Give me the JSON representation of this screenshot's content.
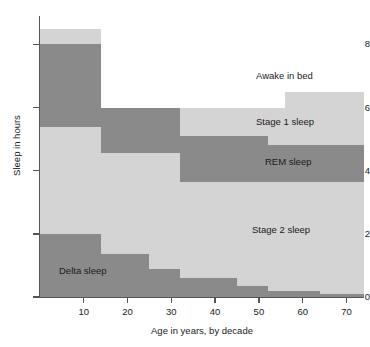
{
  "chart_data": {
    "type": "area",
    "title": "",
    "xlabel": "Age in years, by decade",
    "ylabel": "Sleep in hours",
    "xlim": [
      0,
      74
    ],
    "ylim": [
      0,
      8.9
    ],
    "xticks": [
      10,
      20,
      30,
      40,
      50,
      60,
      70
    ],
    "yticks": [
      0,
      2,
      4,
      6,
      8
    ],
    "grid": false,
    "legend_position": "inline-right",
    "stacking": "stacked-step",
    "x_breakpoints": [
      0,
      14,
      25,
      32,
      35,
      45,
      52,
      56,
      64,
      74
    ],
    "series": [
      {
        "name": "Delta sleep",
        "color": "#8a8a8a",
        "label_x": 14,
        "label_y": 0.95,
        "values": [
          2.0,
          1.35,
          0.9,
          0.6,
          0.6,
          0.35,
          0.2,
          0.2,
          0.1
        ]
      },
      {
        "name": "Stage 2 sleep",
        "color": "#d4d4d4",
        "label_x": 66,
        "label_y": 2.15,
        "values": [
          3.4,
          3.2,
          3.65,
          3.05,
          3.05,
          3.3,
          3.45,
          3.45,
          3.55
        ]
      },
      {
        "name": "REM sleep",
        "color": "#8a8a8a",
        "label_x": 66,
        "label_y": 4.35,
        "values": [
          2.6,
          1.45,
          1.45,
          1.45,
          1.45,
          1.45,
          1.15,
          1.15,
          1.15
        ]
      },
      {
        "name": "Stage 1 sleep",
        "color": "#d4d4d4",
        "label_x": 66,
        "label_y": 5.6,
        "values": [
          0.5,
          0.0,
          0.0,
          0.9,
          0.9,
          0.9,
          1.2,
          1.7,
          1.7
        ]
      },
      {
        "name": "Awake in bed",
        "color": "#ffffff",
        "label_x": 66,
        "label_y": 7.05,
        "values": [
          0.4,
          2.9,
          2.9,
          2.9,
          2.9,
          2.9,
          2.9,
          2.4,
          2.4
        ]
      }
    ],
    "totals": [
      8.5,
      6.0,
      6.0,
      6.0,
      6.0,
      6.0,
      6.0,
      6.5,
      6.5
    ]
  },
  "axis": {
    "ytick_labels": [
      "0",
      "2",
      "4",
      "6",
      "8"
    ],
    "xtick_labels": [
      "10",
      "20",
      "30",
      "40",
      "50",
      "60",
      "70"
    ],
    "ylabel": "Sleep in hours",
    "xlabel": "Age in years, by decade"
  },
  "band_labels": {
    "awake": "Awake in bed",
    "stage1": "Stage 1 sleep",
    "rem": "REM sleep",
    "stage2": "Stage 2 sleep",
    "delta": "Delta sleep"
  }
}
